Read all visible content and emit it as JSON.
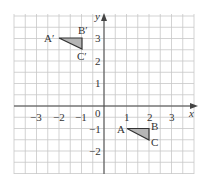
{
  "diagram": {
    "type": "coordinate-plane",
    "axes": {
      "x_label": "x",
      "y_label": "y",
      "origin_label": "0",
      "x_ticks": [
        "−3",
        "−2",
        "−1",
        "1",
        "2",
        "3"
      ],
      "y_ticks": [
        "3",
        "2",
        "1",
        "−1",
        "−2"
      ]
    },
    "grid": {
      "x_range": [
        -3.5,
        4
      ],
      "y_range": [
        -3,
        4
      ],
      "minor_step": 0.5
    },
    "triangles": [
      {
        "name": "ABC",
        "vertices": [
          {
            "label": "A",
            "x": 1,
            "y": -1
          },
          {
            "label": "B",
            "x": 2,
            "y": -1
          },
          {
            "label": "C",
            "x": 2,
            "y": -1.5
          }
        ]
      },
      {
        "name": "A'B'C'",
        "vertices": [
          {
            "label": "A′",
            "x": -2,
            "y": 3
          },
          {
            "label": "B′",
            "x": -1,
            "y": 3
          },
          {
            "label": "C′",
            "x": -1,
            "y": 2.5
          }
        ]
      }
    ],
    "colors": {
      "grid": "#c8c8c8",
      "axis": "#444444",
      "fill": "#b5b5b5",
      "stroke": "#333333"
    }
  }
}
